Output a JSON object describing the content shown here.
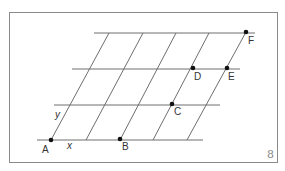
{
  "figure": {
    "number": "8",
    "axis_labels": {
      "x": "x",
      "y": "y"
    },
    "horizontal_lines": [
      {
        "y": 33,
        "x1": 94,
        "x2": 255
      },
      {
        "y": 69,
        "x1": 72,
        "x2": 240
      },
      {
        "y": 105,
        "x1": 54,
        "x2": 220
      },
      {
        "y": 140,
        "x1": 37,
        "x2": 203
      }
    ],
    "slanted_lines": [
      {
        "x1": 51,
        "y1": 140,
        "x2": 109,
        "y2": 33
      },
      {
        "x1": 86,
        "y1": 140,
        "x2": 143,
        "y2": 33
      },
      {
        "x1": 120,
        "y1": 140,
        "x2": 176,
        "y2": 33
      },
      {
        "x1": 153,
        "y1": 140,
        "x2": 209,
        "y2": 33
      },
      {
        "x1": 187,
        "y1": 140,
        "x2": 246,
        "y2": 32
      }
    ],
    "points": [
      {
        "label": "A",
        "x": 51,
        "y": 140,
        "lx": 42,
        "ly": 153
      },
      {
        "label": "B",
        "x": 120,
        "y": 139,
        "lx": 122,
        "ly": 150
      },
      {
        "label": "C",
        "x": 172,
        "y": 104,
        "lx": 174,
        "ly": 115
      },
      {
        "label": "D",
        "x": 193,
        "y": 68,
        "lx": 194,
        "ly": 80
      },
      {
        "label": "E",
        "x": 227,
        "y": 68,
        "lx": 228,
        "ly": 80
      },
      {
        "label": "F",
        "x": 246,
        "y": 32,
        "lx": 248,
        "ly": 44
      }
    ]
  }
}
